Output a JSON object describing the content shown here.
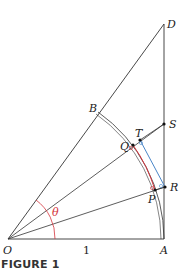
{
  "figure": {
    "caption": "FIGURE 1",
    "labels": {
      "O": "O",
      "A": "A",
      "B": "B",
      "D": "D",
      "S": "S",
      "T": "T",
      "Q": "Q",
      "R": "R",
      "P": "P",
      "theta": "θ",
      "unit": "1"
    },
    "colors": {
      "lines": "#333333",
      "theta_arc": "#d4343c",
      "red_segment": "#d4343c",
      "blue_segment": "#4a86c8"
    },
    "points": {
      "O": [
        8,
        239
      ],
      "A": [
        164,
        239
      ],
      "D": [
        164,
        24
      ],
      "B": [
        98,
        112
      ],
      "S": [
        164,
        124
      ],
      "T": [
        140,
        140
      ],
      "Q": [
        133,
        145
      ],
      "R": [
        165,
        187
      ],
      "P": [
        155,
        190
      ]
    }
  }
}
